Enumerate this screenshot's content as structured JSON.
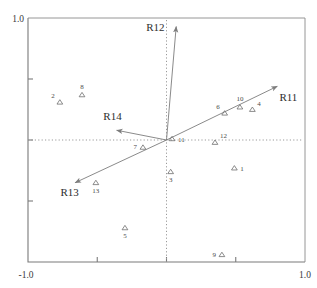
{
  "chart_data": {
    "type": "scatter",
    "title": "",
    "subtitle": "",
    "xlabel": "",
    "ylabel": "",
    "xlim": [
      -1.0,
      1.0
    ],
    "ylim": [
      -1.0,
      1.0
    ],
    "xticks": [
      -1.0,
      -0.5,
      0.0,
      0.5,
      1.0
    ],
    "yticks": [
      -1.0,
      -0.5,
      0.0,
      0.5,
      1.0
    ],
    "xtick_labels": [
      "-1.0",
      "",
      "",
      "",
      "1.0"
    ],
    "ytick_labels": [
      "-1.0",
      "",
      "",
      "",
      "1.0"
    ],
    "grid": false,
    "reference_lines": [
      {
        "name": "vertical-zero-line",
        "axis": "x",
        "value": 0.0,
        "style": "dotted"
      },
      {
        "name": "horizontal-zero-line",
        "axis": "y",
        "value": 0.0,
        "style": "dotted"
      }
    ],
    "legend": null,
    "marker": "triangle-up",
    "points": [
      {
        "label": "1",
        "x": 0.49,
        "y": -0.23,
        "label_pos": "right"
      },
      {
        "label": "2",
        "x": -0.77,
        "y": 0.31,
        "label_pos": "above-left"
      },
      {
        "label": "3",
        "x": 0.03,
        "y": -0.26,
        "label_pos": "below"
      },
      {
        "label": "4",
        "x": 0.62,
        "y": 0.25,
        "label_pos": "above-right"
      },
      {
        "label": "5",
        "x": -0.3,
        "y": -0.72,
        "label_pos": "below"
      },
      {
        "label": "6",
        "x": 0.42,
        "y": 0.22,
        "label_pos": "above-left"
      },
      {
        "label": "7",
        "x": -0.17,
        "y": -0.06,
        "label_pos": "left"
      },
      {
        "label": "8",
        "x": -0.61,
        "y": 0.37,
        "label_pos": "above"
      },
      {
        "label": "9",
        "x": 0.4,
        "y": -0.94,
        "label_pos": "left"
      },
      {
        "label": "10",
        "x": 0.53,
        "y": 0.27,
        "label_pos": "above"
      },
      {
        "label": "11",
        "x": 0.04,
        "y": 0.01,
        "label_pos": "right"
      },
      {
        "label": "12",
        "x": 0.35,
        "y": -0.02,
        "label_pos": "above-right"
      },
      {
        "label": "13",
        "x": -0.51,
        "y": -0.35,
        "label_pos": "below"
      }
    ],
    "vectors": [
      {
        "label": "R11",
        "x": 0.8,
        "y": 0.44,
        "label_x": 0.88,
        "label_y": 0.32
      },
      {
        "label": "R12",
        "x": 0.07,
        "y": 0.93,
        "label_x": -0.08,
        "label_y": 0.89
      },
      {
        "label": "R13",
        "x": -0.66,
        "y": -0.35,
        "label_x": -0.7,
        "label_y": -0.46
      },
      {
        "label": "R14",
        "x": -0.36,
        "y": 0.08,
        "label_x": -0.39,
        "label_y": 0.16
      }
    ]
  },
  "axes": {
    "x_min_label": "-1.0",
    "x_max_label": "1.0",
    "y_min_label": "-1.0",
    "y_max_label": "1.0"
  },
  "colors": {
    "axis": "#7a7a7a",
    "frame": "#8a8a8a",
    "marker": "#6e6e6e",
    "vector": "#7d7d7d",
    "text": "#3a3a3a",
    "dotted": "#9a9a9a",
    "background": "#ffffff"
  }
}
